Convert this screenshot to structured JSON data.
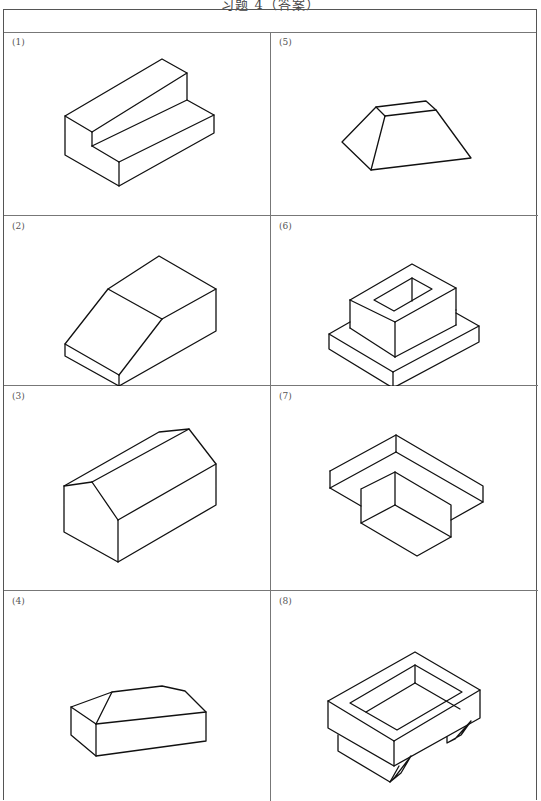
{
  "page": {
    "title": "习题 4（答案）"
  },
  "header_row": {
    "text": ""
  },
  "cells": [
    {
      "label": "(1)",
      "shape": "step-block"
    },
    {
      "label": "(2)",
      "shape": "chamfered-block"
    },
    {
      "label": "(3)",
      "shape": "gable-prism"
    },
    {
      "label": "(4)",
      "shape": "hipped-block"
    },
    {
      "label": "(5)",
      "shape": "truncated-prism"
    },
    {
      "label": "(6)",
      "shape": "hollow-box-on-plate"
    },
    {
      "label": "(7)",
      "shape": "inverted-t-block"
    },
    {
      "label": "(8)",
      "shape": "tray-with-feet"
    }
  ]
}
